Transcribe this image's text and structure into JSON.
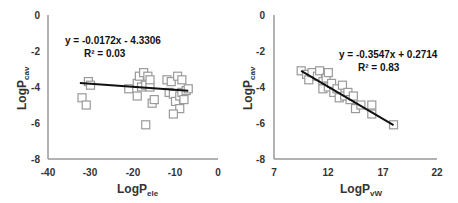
{
  "chart_data": [
    {
      "type": "scatter",
      "title": "",
      "xlabel": "LogP",
      "xlabel_sub": "ele",
      "ylabel": "LogP",
      "ylabel_sub": "cav",
      "xlim": [
        -40,
        0
      ],
      "ylim": [
        -8,
        0
      ],
      "x_ticks": [
        "-40",
        "-30",
        "-20",
        "-10",
        "0"
      ],
      "y_ticks": [
        "0",
        "-2",
        "-4",
        "-6",
        "-8"
      ],
      "grid": false,
      "trendline": {
        "slope": -0.0172,
        "intercept": -4.3306,
        "x_range": [
          -32.5,
          -7
        ]
      },
      "equation": "y = -0.0172x - 4.3306",
      "r2": "R² = 0.03",
      "points": [
        [
          -30.5,
          -3.7
        ],
        [
          -30,
          -3.9
        ],
        [
          -32,
          -4.6
        ],
        [
          -31,
          -5.0
        ],
        [
          -21,
          -4.1
        ],
        [
          -19,
          -4.5
        ],
        [
          -19,
          -3.8
        ],
        [
          -18.5,
          -3.4
        ],
        [
          -18,
          -4.0
        ],
        [
          -17.5,
          -3.2
        ],
        [
          -17,
          -3.9
        ],
        [
          -16.5,
          -3.4
        ],
        [
          -16,
          -4.0
        ],
        [
          -16,
          -3.6
        ],
        [
          -15.5,
          -4.9
        ],
        [
          -15,
          -4.7
        ],
        [
          -17,
          -6.1
        ],
        [
          -12,
          -3.6
        ],
        [
          -11.5,
          -4.3
        ],
        [
          -11,
          -3.7
        ],
        [
          -10.5,
          -4.4
        ],
        [
          -10,
          -4.8
        ],
        [
          -9.5,
          -3.4
        ],
        [
          -9,
          -4.5
        ],
        [
          -9,
          -5.2
        ],
        [
          -8.5,
          -3.6
        ],
        [
          -8.5,
          -4.3
        ],
        [
          -8,
          -4.7
        ],
        [
          -7.5,
          -4.2
        ],
        [
          -10.5,
          -5.5
        ],
        [
          -7,
          -4.1
        ]
      ]
    },
    {
      "type": "scatter",
      "title": "",
      "xlabel": "LogP",
      "xlabel_sub": "vW",
      "ylabel": "LogP",
      "ylabel_sub": "cav",
      "xlim": [
        7,
        22
      ],
      "ylim": [
        -8,
        0
      ],
      "x_ticks": [
        "7",
        "12",
        "17",
        "22"
      ],
      "y_ticks": [
        "0",
        "-2",
        "-4",
        "-6",
        "-8"
      ],
      "grid": false,
      "trendline": {
        "slope": -0.3547,
        "intercept": 0.2714,
        "x_range": [
          9.5,
          18
        ]
      },
      "equation": "y = -0.3547x + 0.2714",
      "r2": "R² = 0.83",
      "points": [
        [
          9.5,
          -3.1
        ],
        [
          10,
          -3.3
        ],
        [
          10.2,
          -3.6
        ],
        [
          10.5,
          -3.2
        ],
        [
          11,
          -3.4
        ],
        [
          11.2,
          -3.1
        ],
        [
          11.5,
          -3.7
        ],
        [
          11.5,
          -4.1
        ],
        [
          11.8,
          -3.5
        ],
        [
          12,
          -3.2
        ],
        [
          12,
          -4.0
        ],
        [
          12.3,
          -3.8
        ],
        [
          12.5,
          -4.3
        ],
        [
          12.8,
          -4.1
        ],
        [
          13,
          -4.6
        ],
        [
          13.3,
          -3.9
        ],
        [
          13.5,
          -4.5
        ],
        [
          13.8,
          -4.3
        ],
        [
          14,
          -4.7
        ],
        [
          14.3,
          -4.5
        ],
        [
          14.5,
          -5.2
        ],
        [
          15,
          -5.0
        ],
        [
          16,
          -5.5
        ],
        [
          16,
          -5.0
        ],
        [
          18,
          -6.1
        ]
      ]
    }
  ],
  "charts": [
    {
      "equation": "y = -0.0172x - 4.3306",
      "r2": "R² = 0.03",
      "xlabel_main": "LogP",
      "xlabel_sub": "ele",
      "ylabel_main": "LogP",
      "ylabel_sub": "cav",
      "x_ticks": [
        "-40",
        "-30",
        "-20",
        "-10",
        "0"
      ],
      "y_ticks": [
        "0",
        "-2",
        "-4",
        "-6",
        "-8"
      ]
    },
    {
      "equation": "y = -0.3547x + 0.2714",
      "r2": "R² = 0.83",
      "xlabel_main": "LogP",
      "xlabel_sub": "vW",
      "ylabel_main": "LogP",
      "ylabel_sub": "cav",
      "x_ticks": [
        "7",
        "12",
        "17",
        "22"
      ],
      "y_ticks": [
        "0",
        "-2",
        "-4",
        "-6",
        "-8"
      ]
    }
  ],
  "colors": {
    "axis": "#999999",
    "marker_stroke": "#9a9a9a",
    "marker_fill": "#ffffff",
    "trendline": "#111111",
    "text": "#333333"
  }
}
